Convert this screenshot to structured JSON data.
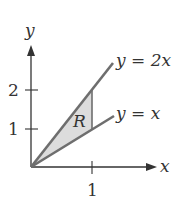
{
  "diagram": {
    "axes": {
      "x_label": "x",
      "y_label": "y"
    },
    "ticks": {
      "x": [
        "1"
      ],
      "y": [
        "1",
        "2"
      ]
    },
    "curves": [
      {
        "label": "y = 2x",
        "color": "#6e6e6e"
      },
      {
        "label": "y = x",
        "color": "#6e6e6e"
      }
    ],
    "region": {
      "label": "R",
      "fill": "#dcdcdc"
    }
  }
}
